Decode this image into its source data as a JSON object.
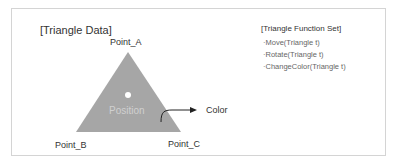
{
  "diagram": {
    "title": "[Triangle Data]",
    "triangle": {
      "vertices": {
        "a": "Point_A",
        "b": "Point_B",
        "c": "Point_C"
      },
      "center_label": "Position",
      "fill_color": "#a6a6a6"
    },
    "color_label": "Color"
  },
  "function_set": {
    "title": "[Triangle Function Set]",
    "items": [
      "·Move(Triangle t)",
      "·Rotate(Triangle t)",
      "·ChangeColor(Triangle t)"
    ]
  }
}
